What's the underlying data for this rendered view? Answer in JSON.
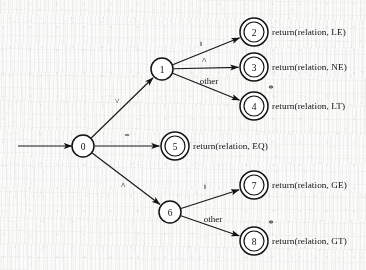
{
  "diagram": {
    "type": "finite-state-machine",
    "start_state": "0",
    "ink_color": "#131313",
    "paper_color": "#fbfbfa"
  },
  "states": [
    {
      "id": "s0",
      "label": "0",
      "accepting": false,
      "retract": false,
      "cx": 83,
      "cy": 146,
      "r": 11
    },
    {
      "id": "s1",
      "label": "1",
      "accepting": false,
      "retract": false,
      "cx": 162,
      "cy": 69,
      "r": 11
    },
    {
      "id": "s2",
      "label": "2",
      "accepting": true,
      "retract": false,
      "cx": 254,
      "cy": 32,
      "r": 11
    },
    {
      "id": "s3",
      "label": "3",
      "accepting": true,
      "retract": false,
      "cx": 254,
      "cy": 67,
      "r": 11
    },
    {
      "id": "s4",
      "label": "4",
      "accepting": true,
      "retract": true,
      "cx": 254,
      "cy": 106,
      "r": 11
    },
    {
      "id": "s5",
      "label": "5",
      "accepting": true,
      "retract": false,
      "cx": 175,
      "cy": 146,
      "r": 11
    },
    {
      "id": "s6",
      "label": "6",
      "accepting": false,
      "retract": false,
      "cx": 170,
      "cy": 212,
      "r": 11
    },
    {
      "id": "s7",
      "label": "7",
      "accepting": true,
      "retract": false,
      "cx": 254,
      "cy": 185,
      "r": 11
    },
    {
      "id": "s8",
      "label": "8",
      "accepting": true,
      "retract": true,
      "cx": 254,
      "cy": 241,
      "r": 11
    }
  ],
  "start_arrow": {
    "name": "start-arrow",
    "x1": 18,
    "y1": 146,
    "x2": 72,
    "y2": 146
  },
  "transitions": [
    {
      "id": "t0-1",
      "from": "s0",
      "to": "s1",
      "label": "<",
      "lx": 120,
      "ly": 101,
      "rotate": -90
    },
    {
      "id": "t0-5",
      "from": "s0",
      "to": "s5",
      "label": "=",
      "lx": 127,
      "ly": 138,
      "rotate": 0
    },
    {
      "id": "t0-6",
      "from": "s0",
      "to": "s6",
      "label": ">",
      "lx": 126,
      "ly": 185,
      "rotate": -90
    },
    {
      "id": "t1-2",
      "from": "s1",
      "to": "s2",
      "label": "=",
      "lx": 204,
      "ly": 44,
      "rotate": -90
    },
    {
      "id": "t1-3",
      "from": "s1",
      "to": "s3",
      "label": ">",
      "lx": 207,
      "ly": 60,
      "rotate": -90
    },
    {
      "id": "t1-4",
      "from": "s1",
      "to": "s4",
      "label": "other",
      "lx": 209,
      "ly": 84,
      "rotate": 0
    },
    {
      "id": "t6-7",
      "from": "s6",
      "to": "s7",
      "label": "=",
      "lx": 208,
      "ly": 187,
      "rotate": -90
    },
    {
      "id": "t6-8",
      "from": "s6",
      "to": "s8",
      "label": "other",
      "lx": 213,
      "ly": 222,
      "rotate": 0
    }
  ],
  "actions": [
    {
      "id": "a2",
      "state": "s2",
      "text": "return(relation, LE)",
      "x": 272,
      "y": 32
    },
    {
      "id": "a3",
      "state": "s3",
      "text": "return(relation, NE)",
      "x": 272,
      "y": 67
    },
    {
      "id": "a4",
      "state": "s4",
      "text": "return(relation, LT)",
      "x": 272,
      "y": 106
    },
    {
      "id": "a5",
      "state": "s5",
      "text": "return(relation, EQ)",
      "x": 193,
      "y": 146
    },
    {
      "id": "a7",
      "state": "s7",
      "text": "return(relation, GE)",
      "x": 272,
      "y": 185
    },
    {
      "id": "a8",
      "state": "s8",
      "text": "return(relation, GT)",
      "x": 272,
      "y": 241
    }
  ],
  "retract_markers": [
    {
      "id": "m4",
      "state": "s4",
      "symbol": "*",
      "x": 271,
      "y": 92
    },
    {
      "id": "m8",
      "state": "s8",
      "symbol": "*",
      "x": 271,
      "y": 227
    }
  ]
}
